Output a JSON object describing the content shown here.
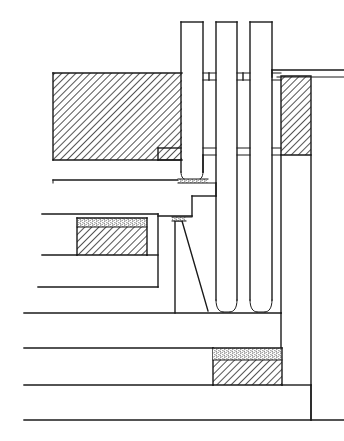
{
  "drawing": {
    "title": "Architectural Section Detail",
    "type": "cad-section-drawing",
    "canvas": {
      "width": 344,
      "height": 441,
      "background": "#ffffff"
    },
    "line_color": "#1a1a1a",
    "hatch_color": "#1a1a1a",
    "stipple_color": "#4a4a4a",
    "labels": [],
    "annotations": [],
    "dimensions": [],
    "elements": {
      "upper_left_hatched_wall": {
        "x": 53,
        "y": 73,
        "width": 129,
        "height": 87,
        "fill": "diagonal-hatch"
      },
      "upper_right_hatched_wall": {
        "x": 281,
        "y": 76,
        "width": 30,
        "height": 79,
        "fill": "diagonal-hatch"
      },
      "mid_left_block_stipple": {
        "x": 77,
        "y": 218,
        "width": 70,
        "height": 9,
        "fill": "stipple"
      },
      "mid_left_block_hatch": {
        "x": 77,
        "y": 227,
        "width": 70,
        "height": 28,
        "fill": "diagonal-hatch"
      },
      "lower_block_stipple": {
        "x": 213,
        "y": 348,
        "width": 69,
        "height": 12,
        "fill": "stipple"
      },
      "lower_block_hatch": {
        "x": 213,
        "y": 360,
        "width": 69,
        "height": 25,
        "fill": "diagonal-hatch"
      },
      "vertical_bar_1": {
        "x": 181,
        "y": 22,
        "width": 22,
        "height": 158
      },
      "vertical_bar_2": {
        "x": 216,
        "y": 22,
        "width": 21,
        "height": 290
      },
      "vertical_bar_3": {
        "x": 250,
        "y": 22,
        "width": 22,
        "height": 290
      },
      "tapered_wedge": {
        "top_x": 175,
        "top_y": 220,
        "bottom_left_x": 175,
        "bottom_right_x": 208,
        "bottom_y": 313
      }
    }
  }
}
